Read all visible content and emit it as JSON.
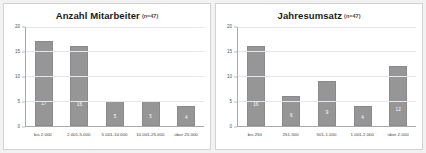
{
  "page": {
    "background_color": "#f2f2f2",
    "panel_color": "#ffffff",
    "bar_color": "#969696",
    "grid_color": "#e2e7ef",
    "axis_color": "#a9a9a9"
  },
  "charts": [
    {
      "title": "Anzahl Mitarbeiter",
      "n_note": "(n=47)",
      "chart_data": {
        "type": "bar",
        "title": "Anzahl Mitarbeiter (n=47)",
        "categories": [
          "bis 2.000",
          "2.001-5.000",
          "5.001-10.000",
          "10.001-25.000",
          "über 25.000"
        ],
        "values": [
          17,
          16,
          5,
          5,
          4
        ],
        "xlabel": "",
        "ylabel": "",
        "ylim": [
          0,
          20
        ],
        "yticks": [
          0,
          5,
          10,
          15,
          20
        ],
        "grid": true,
        "legend": "none"
      }
    },
    {
      "title": "Jahresumsatz",
      "n_note": "(n=47)",
      "chart_data": {
        "type": "bar",
        "title": "Jahresumsatz (n=47)",
        "categories": [
          "bis 250",
          "251-500",
          "501-1.000",
          "1.001-2.000",
          "über 2.000"
        ],
        "values": [
          16,
          6,
          9,
          4,
          12
        ],
        "xlabel": "",
        "ylabel": "",
        "ylim": [
          0,
          20
        ],
        "yticks": [
          0,
          5,
          10,
          15,
          20
        ],
        "grid": true,
        "legend": "none"
      }
    }
  ]
}
